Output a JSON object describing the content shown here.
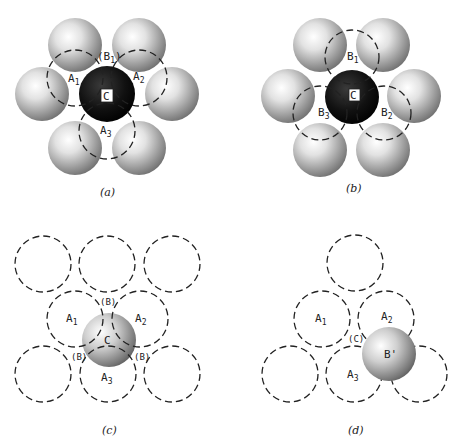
{
  "figure": {
    "panels": [
      {
        "id": "a",
        "caption": "(a)",
        "labels": {
          "A1": "A",
          "A1_sub": "1",
          "A2": "A",
          "A2_sub": "2",
          "A3": "A",
          "A3_sub": "3",
          "B1": "(B",
          "B1_sub": "1",
          "B1_close": ")",
          "C": "C"
        }
      },
      {
        "id": "b",
        "caption": "(b)",
        "labels": {
          "B1": "B",
          "B1_sub": "1",
          "B2": "B",
          "B2_sub": "2",
          "B3": "B",
          "B3_sub": "3",
          "C": "C"
        }
      },
      {
        "id": "c",
        "caption": "(c)",
        "labels": {
          "A1": "A",
          "A1_sub": "1",
          "A2": "A",
          "A2_sub": "2",
          "A3": "A",
          "A3_sub": "3",
          "B_top": "(B)",
          "B_left": "(B)",
          "B_right": "(B)",
          "C": "C"
        }
      },
      {
        "id": "d",
        "caption": "(d)",
        "labels": {
          "A1": "A",
          "A1_sub": "1",
          "A2": "A",
          "A2_sub": "2",
          "A3": "A",
          "A3_sub": "3",
          "C": "(C)",
          "Bprime": "B'"
        }
      }
    ]
  },
  "colors": {
    "sphere_dark": "#111111",
    "sphere_grey": "#8a8a8a",
    "line": "#222222",
    "background": "#ffffff"
  }
}
